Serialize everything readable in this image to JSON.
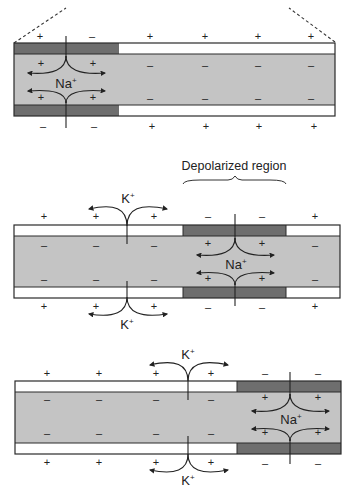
{
  "colors": {
    "axoplasm": "#c4c4c4",
    "membrane_resting": "#ffffff",
    "membrane_depolarized": "#6e6e6e",
    "outline": "#2a2a2a",
    "text": "#222222"
  },
  "labels": {
    "depolarized_region": "Depolarized region",
    "na_ion": "Na",
    "k_ion": "K",
    "ion_charge": "+"
  },
  "panels": [
    {
      "name": "panel-1-initial-depolarization",
      "top_outside_signs": [
        "+",
        "–",
        "+",
        "+",
        "+",
        "+"
      ],
      "top_inside_signs": [
        "+",
        "+",
        "–",
        "–",
        "–",
        "–"
      ],
      "bottom_inside_signs": [
        "+",
        "+",
        "–",
        "–",
        "–",
        "–"
      ],
      "bottom_outside_signs": [
        "–",
        "–",
        "+",
        "+",
        "+",
        "+"
      ],
      "channels": [
        {
          "ion": "Na+",
          "direction": "inward"
        }
      ]
    },
    {
      "name": "panel-2-propagation",
      "region_label": "Depolarized region",
      "top_outside_signs": [
        "+",
        "+",
        "+",
        "–",
        "–",
        "+"
      ],
      "top_inside_signs": [
        "–",
        "–",
        "–",
        "+",
        "+",
        "–"
      ],
      "bottom_inside_signs": [
        "–",
        "–",
        "–",
        "+",
        "+",
        "–"
      ],
      "bottom_outside_signs": [
        "+",
        "+",
        "+",
        "–",
        "–",
        "+"
      ],
      "channels": [
        {
          "ion": "K+",
          "direction": "outward"
        },
        {
          "ion": "Na+",
          "direction": "inward"
        }
      ]
    },
    {
      "name": "panel-3-further-propagation",
      "top_outside_signs": [
        "+",
        "+",
        "+",
        "+",
        "–",
        "–"
      ],
      "top_inside_signs": [
        "–",
        "–",
        "–",
        "–",
        "+",
        "+"
      ],
      "bottom_inside_signs": [
        "–",
        "–",
        "–",
        "–",
        "+",
        "+"
      ],
      "bottom_outside_signs": [
        "+",
        "+",
        "+",
        "+",
        "–",
        "–"
      ],
      "channels": [
        {
          "ion": "K+",
          "direction": "outward"
        },
        {
          "ion": "Na+",
          "direction": "inward"
        }
      ]
    }
  ]
}
